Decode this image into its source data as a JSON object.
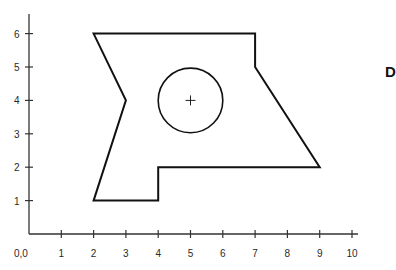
{
  "figure": {
    "label": "D",
    "origin_label": "0,0",
    "x_ticks": [
      "1",
      "2",
      "3",
      "4",
      "5",
      "6",
      "7",
      "8",
      "9",
      "10"
    ],
    "y_ticks": [
      "1",
      "2",
      "3",
      "4",
      "5",
      "6"
    ]
  },
  "diagram_data": {
    "type": "geometry",
    "axes": {
      "x_range": [
        0,
        10
      ],
      "y_range": [
        0,
        6
      ]
    },
    "polygon": {
      "name": "shape",
      "vertices": [
        [
          2,
          6
        ],
        [
          7,
          6
        ],
        [
          7,
          5
        ],
        [
          9,
          2
        ],
        [
          4,
          2
        ],
        [
          4,
          1
        ],
        [
          2,
          1
        ],
        [
          3,
          4
        ]
      ]
    },
    "circle": {
      "center": [
        5,
        4
      ],
      "radius": 1,
      "center_marker": "+"
    }
  }
}
